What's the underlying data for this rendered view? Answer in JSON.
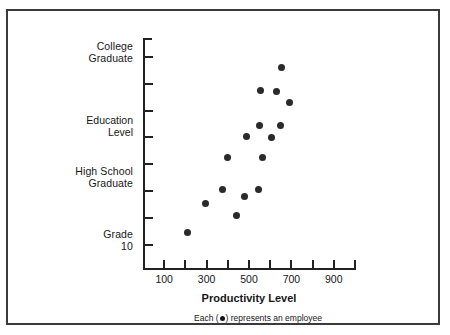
{
  "chart_data": {
    "type": "scatter",
    "title": "",
    "xlabel": "Productivity Level",
    "ylabel": "Education Level",
    "xlim": [
      0,
      1000
    ],
    "ylim": [
      0,
      9
    ],
    "grid": false,
    "legend": "none",
    "caption": "Each (  ) represents an employee",
    "caption_prefix": "Each (",
    "caption_suffix": ") represents an employee",
    "marker": "filled-circle",
    "marker_color": "#2a2a2c",
    "x_ticks": [
      100,
      200,
      300,
      400,
      500,
      600,
      700,
      800,
      900,
      1000
    ],
    "x_tick_labels": [
      "100",
      "",
      "300",
      "",
      "500",
      "",
      "700",
      "",
      "900",
      ""
    ],
    "y_tick_levels": [
      8,
      7,
      6,
      5,
      4,
      3,
      2,
      1
    ],
    "y_category_labels": [
      {
        "id": "college-graduate",
        "line1": "College",
        "line2": "Graduate",
        "level": 8
      },
      {
        "id": "high-school-graduate",
        "line1": "High School",
        "line2": "Graduate",
        "level": 3
      },
      {
        "id": "grade-10",
        "line1": "Grade",
        "line2": "10",
        "level": 1
      }
    ],
    "axis_title_y_line1": "Education",
    "axis_title_y_line2": "Level",
    "points": [
      {
        "x": 210,
        "y": 1.45
      },
      {
        "x": 295,
        "y": 2.55
      },
      {
        "x": 375,
        "y": 3.05
      },
      {
        "x": 400,
        "y": 4.25
      },
      {
        "x": 440,
        "y": 2.1
      },
      {
        "x": 480,
        "y": 2.8
      },
      {
        "x": 490,
        "y": 5.05
      },
      {
        "x": 545,
        "y": 3.05
      },
      {
        "x": 550,
        "y": 5.45
      },
      {
        "x": 555,
        "y": 6.75
      },
      {
        "x": 565,
        "y": 4.25
      },
      {
        "x": 605,
        "y": 5.0
      },
      {
        "x": 630,
        "y": 6.7
      },
      {
        "x": 650,
        "y": 5.45
      },
      {
        "x": 655,
        "y": 7.6
      },
      {
        "x": 690,
        "y": 6.3
      }
    ]
  }
}
